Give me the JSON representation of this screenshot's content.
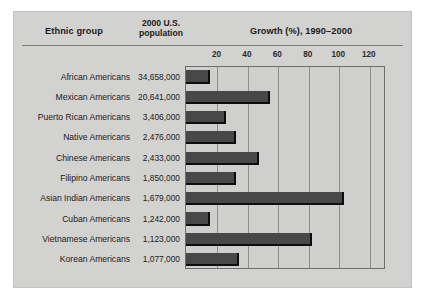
{
  "figure": {
    "headers": {
      "ethnic_group": "Ethnic group",
      "population_line1": "2000 U.S.",
      "population_line2": "population",
      "growth": "Growth (%), 1990–2000"
    }
  },
  "chart_data": {
    "type": "bar",
    "orientation": "horizontal",
    "title": "Growth (%), 1990–2000",
    "xlabel": "Growth (%), 1990–2000",
    "ylabel": "Ethnic group",
    "xlim": [
      0,
      130
    ],
    "grid": true,
    "legend": null,
    "tick_labels": [
      "20",
      "40",
      "60",
      "80",
      "100",
      "120"
    ],
    "tick_values": [
      20,
      40,
      60,
      80,
      100,
      120
    ],
    "categories": [
      "African Americans",
      "Mexican Americans",
      "Puerto Rican Americans",
      "Native Americans",
      "Chinese Americans",
      "Filipino Americans",
      "Asian Indian Americans",
      "Cuban Americans",
      "Vietnamese Americans",
      "Korean Americans"
    ],
    "values": [
      16,
      55,
      26,
      33,
      48,
      33,
      104,
      16,
      83,
      35
    ],
    "populations": [
      "34,658,000",
      "20,641,000",
      "3,406,000",
      "2,476,000",
      "2,433,000",
      "1,850,000",
      "1,679,000",
      "1,242,000",
      "1,123,000",
      "1,077,000"
    ],
    "colors": {
      "bar": "#484848",
      "bar_shadow": "#0d0d0d",
      "plot_background": "#cfcfcd",
      "plate_background": "#d2d2d0",
      "gridline": "#8e8e8c",
      "text": "#1b1b1b"
    }
  }
}
